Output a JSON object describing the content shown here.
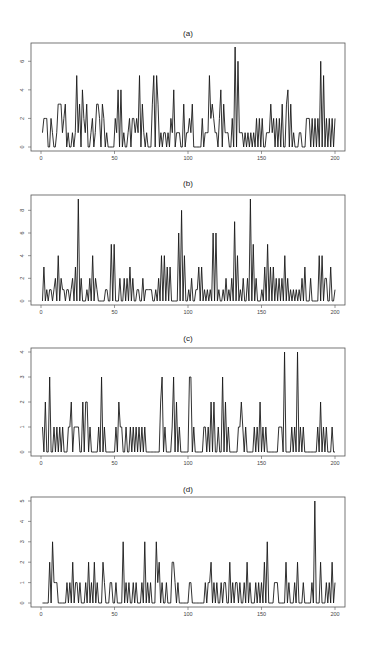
{
  "chart_data": [
    {
      "type": "line",
      "title": "(a)",
      "xlabel": "",
      "ylabel": "",
      "xlim": [
        0,
        200
      ],
      "ylim": [
        0,
        7
      ],
      "xticks": [
        0,
        50,
        100,
        150,
        200
      ],
      "yticks": [
        0,
        2,
        4,
        6
      ],
      "grid": false,
      "series": [
        {
          "name": "a",
          "values": [
            1,
            2,
            2,
            2,
            0,
            0,
            2,
            1,
            0,
            0,
            1,
            3,
            3,
            3,
            1,
            2,
            3,
            0,
            1,
            0,
            0,
            1,
            0,
            1,
            5,
            1,
            3,
            0,
            4,
            2,
            1,
            3,
            0,
            0,
            1,
            2,
            0,
            1,
            3,
            3,
            2,
            0,
            3,
            2,
            0,
            1,
            0,
            0,
            0,
            0,
            0,
            2,
            1,
            4,
            0,
            4,
            0,
            1,
            0,
            0,
            1,
            2,
            0,
            2,
            2,
            1,
            2,
            1,
            5,
            0,
            3,
            1,
            0,
            1,
            0,
            0,
            0,
            3,
            5,
            0,
            5,
            3,
            0,
            1,
            0,
            1,
            1,
            0,
            1,
            0,
            2,
            1,
            4,
            0,
            1,
            1,
            1,
            0,
            0,
            3,
            0,
            1,
            1,
            2,
            1,
            3,
            0,
            0,
            0,
            0,
            0,
            0,
            2,
            0,
            1,
            1,
            1,
            5,
            2,
            3,
            2,
            1,
            1,
            0,
            2,
            4,
            0,
            3,
            1,
            1,
            1,
            0,
            0,
            2,
            0,
            7,
            0,
            6,
            1,
            1,
            1,
            0,
            1,
            0,
            1,
            0,
            1,
            0,
            1,
            0,
            2,
            0,
            2,
            0,
            2,
            0,
            0,
            1,
            1,
            1,
            3,
            1,
            2,
            0,
            2,
            0,
            2,
            0,
            3,
            0,
            0,
            3,
            4,
            0,
            3,
            0,
            1,
            0,
            0,
            0,
            1,
            1,
            0,
            0,
            0,
            2,
            2,
            2,
            0,
            2,
            0,
            2,
            0,
            2,
            0,
            6,
            0,
            5,
            0,
            2,
            0,
            2,
            0,
            2,
            0,
            2
          ]
        }
      ]
    },
    {
      "type": "line",
      "title": "(b)",
      "xlabel": "",
      "ylabel": "",
      "xlim": [
        0,
        200
      ],
      "ylim": [
        0,
        9
      ],
      "xticks": [
        0,
        50,
        100,
        150,
        200
      ],
      "yticks": [
        0,
        2,
        4,
        6,
        8
      ],
      "grid": false,
      "series": [
        {
          "name": "b",
          "values": [
            0,
            3,
            0,
            1,
            0,
            1,
            1,
            0,
            1,
            2,
            0,
            4,
            0,
            2,
            1,
            1,
            0,
            1,
            1,
            0,
            1,
            2,
            0,
            3,
            0,
            9,
            0,
            2,
            0,
            0,
            0,
            1,
            0,
            2,
            0,
            4,
            0,
            2,
            1,
            0,
            0,
            0,
            0,
            0,
            1,
            1,
            0,
            0,
            5,
            0,
            5,
            0,
            0,
            0,
            2,
            0,
            0,
            2,
            0,
            2,
            0,
            3,
            0,
            2,
            0,
            0,
            1,
            1,
            0,
            0,
            2,
            0,
            1,
            1,
            1,
            1,
            1,
            0,
            0,
            1,
            0,
            2,
            0,
            4,
            0,
            4,
            0,
            3,
            0,
            3,
            0,
            0,
            0,
            0,
            0,
            6,
            0,
            8,
            0,
            4,
            0,
            0,
            1,
            0,
            2,
            0,
            0,
            1,
            1,
            3,
            0,
            3,
            0,
            1,
            0,
            1,
            0,
            1,
            0,
            6,
            0,
            6,
            0,
            1,
            0,
            0,
            1,
            0,
            2,
            0,
            1,
            0,
            2,
            0,
            7,
            0,
            4,
            0,
            1,
            0,
            2,
            0,
            0,
            2,
            0,
            9,
            0,
            5,
            0,
            2,
            0,
            0,
            0,
            1,
            0,
            3,
            0,
            5,
            0,
            3,
            0,
            3,
            0,
            2,
            0,
            2,
            0,
            2,
            0,
            4,
            0,
            2,
            0,
            1,
            0,
            1,
            0,
            1,
            0,
            1,
            0,
            2,
            0,
            3,
            0,
            0,
            0,
            2,
            0,
            0,
            0,
            0,
            0,
            4,
            0,
            4,
            0,
            2,
            2,
            0,
            0,
            3,
            0,
            0,
            1
          ]
        }
      ]
    },
    {
      "type": "line",
      "title": "(c)",
      "xlabel": "",
      "ylabel": "",
      "xlim": [
        0,
        200
      ],
      "ylim": [
        0,
        4
      ],
      "xticks": [
        0,
        50,
        100,
        150,
        200
      ],
      "yticks": [
        0,
        1,
        2,
        3,
        4
      ],
      "grid": false,
      "series": [
        {
          "name": "c",
          "values": [
            1,
            0,
            2,
            0,
            0,
            3,
            0,
            0,
            1,
            0,
            1,
            0,
            1,
            0,
            1,
            0,
            0,
            0,
            1,
            1,
            2,
            0,
            1,
            1,
            1,
            1,
            0,
            0,
            2,
            0,
            2,
            2,
            0,
            1,
            0,
            0,
            0,
            0,
            0,
            1,
            0,
            3,
            0,
            1,
            0,
            0,
            0,
            0,
            0,
            0,
            0,
            1,
            0,
            2,
            1,
            1,
            0,
            0,
            1,
            0,
            0,
            1,
            0,
            1,
            0,
            1,
            0,
            1,
            0,
            1,
            0,
            1,
            0,
            0,
            0,
            0,
            0,
            0,
            0,
            0,
            0,
            0,
            2,
            3,
            0,
            1,
            0,
            0,
            0,
            0,
            1,
            3,
            0,
            2,
            0,
            1,
            0,
            0,
            0,
            0,
            0,
            0,
            3,
            3,
            0,
            1,
            0,
            0,
            0,
            0,
            0,
            0,
            1,
            1,
            0,
            1,
            0,
            2,
            0,
            2,
            0,
            0,
            1,
            0,
            0,
            3,
            0,
            2,
            0,
            1,
            0,
            0,
            0,
            0,
            0,
            0,
            1,
            1,
            2,
            1,
            0,
            1,
            0,
            0,
            0,
            0,
            0,
            1,
            0,
            1,
            0,
            2,
            0,
            1,
            0,
            1,
            0,
            0,
            0,
            0,
            0,
            0,
            0,
            0,
            1,
            1,
            1,
            0,
            4,
            0,
            0,
            0,
            0,
            1,
            0,
            1,
            0,
            4,
            0,
            1,
            0,
            1,
            0,
            0,
            0,
            0,
            0,
            0,
            0,
            0,
            0,
            1,
            0,
            2,
            0,
            1,
            0,
            1,
            0,
            0,
            0,
            1,
            0,
            0
          ]
        }
      ]
    },
    {
      "type": "line",
      "title": "(d)",
      "xlabel": "",
      "ylabel": "",
      "xlim": [
        0,
        200
      ],
      "ylim": [
        0,
        5
      ],
      "xticks": [
        0,
        50,
        100,
        150,
        200
      ],
      "yticks": [
        0,
        1,
        2,
        3,
        4,
        5
      ],
      "grid": false,
      "series": [
        {
          "name": "d",
          "values": [
            0,
            0,
            0,
            0,
            0,
            2,
            0,
            3,
            1,
            1,
            1,
            0,
            0,
            0,
            0,
            0,
            0,
            1,
            0,
            1,
            0,
            2,
            0,
            1,
            1,
            0,
            1,
            0,
            0,
            0,
            1,
            0,
            2,
            0,
            1,
            0,
            2,
            0,
            1,
            0,
            0,
            0,
            2,
            1,
            0,
            0,
            0,
            1,
            1,
            0,
            0,
            1,
            0,
            0,
            0,
            0,
            3,
            0,
            1,
            0,
            1,
            0,
            0,
            1,
            0,
            1,
            0,
            0,
            0,
            1,
            0,
            3,
            0,
            1,
            0,
            1,
            0,
            0,
            0,
            3,
            1,
            2,
            0,
            1,
            0,
            0,
            1,
            0,
            0,
            0,
            2,
            2,
            1,
            0,
            1,
            0,
            0,
            0,
            0,
            0,
            0,
            0,
            1,
            1,
            0,
            0,
            0,
            0,
            0,
            0,
            0,
            0,
            0,
            1,
            0,
            1,
            1,
            2,
            0,
            1,
            0,
            1,
            0,
            0,
            1,
            0,
            1,
            1,
            0,
            0,
            2,
            0,
            1,
            0,
            1,
            1,
            0,
            1,
            0,
            0,
            1,
            0,
            2,
            0,
            1,
            0,
            0,
            0,
            1,
            0,
            1,
            0,
            1,
            0,
            2,
            0,
            3,
            0,
            0,
            0,
            0,
            1,
            1,
            1,
            0,
            0,
            0,
            0,
            0,
            2,
            0,
            1,
            0,
            0,
            0,
            1,
            0,
            2,
            0,
            0,
            0,
            1,
            0,
            0,
            0,
            0,
            0,
            1,
            0,
            5,
            0,
            0,
            0,
            2,
            0,
            0,
            0,
            1,
            0,
            1,
            0,
            2,
            0,
            1
          ]
        }
      ]
    }
  ],
  "panels": [
    {
      "title": "(a)"
    },
    {
      "title": "(b)"
    },
    {
      "title": "(c)"
    },
    {
      "title": "(d)"
    }
  ],
  "x_tick_labels": [
    "0",
    "50",
    "100",
    "150",
    "200"
  ],
  "colors": {
    "line": "#1a1a1a",
    "frame": "#555555",
    "background": "#ffffff"
  }
}
